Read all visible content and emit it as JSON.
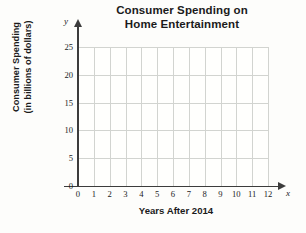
{
  "chart_data": {
    "type": "line",
    "title": "Consumer Spending on Home Entertainment",
    "title_lines": [
      "Consumer Spending on",
      "Home Entertainment"
    ],
    "xlabel": "Years After 2014",
    "ylabel": "Consumer Spending (in billions of dollars)",
    "ylabel_lines": [
      "Consumer Spending",
      "(in billions of dollars)"
    ],
    "x_variable": "x",
    "y_variable": "y",
    "xlim": [
      0,
      12
    ],
    "ylim": [
      0,
      25
    ],
    "x_ticks": [
      0,
      1,
      2,
      3,
      4,
      5,
      6,
      7,
      8,
      9,
      10,
      11,
      12
    ],
    "y_ticks": [
      0,
      5,
      10,
      15,
      20,
      25
    ],
    "x_tick_labels": [
      "0",
      "1",
      "2",
      "3",
      "4",
      "5",
      "6",
      "7",
      "8",
      "9",
      "10",
      "11",
      "12"
    ],
    "y_tick_labels": [
      "0",
      "5",
      "10",
      "15",
      "20",
      "25"
    ],
    "grid": true,
    "grid_color": "#d2d4d0",
    "axis_color": "#3c3c3c",
    "background_color": "#fdfdfb",
    "legend": null,
    "series": [],
    "values": [],
    "categories": [],
    "annotations": [],
    "note": "Empty coordinate grid with no plotted data points"
  }
}
